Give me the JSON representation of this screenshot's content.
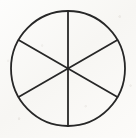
{
  "figure": {
    "title": "Circle divided into six equal sectors",
    "kind": "geometry-diagram",
    "medium": "hand-drawn ink on scanned paper",
    "canvas": {
      "width": 136,
      "height": 138
    },
    "background_color": "#fbfbfa",
    "ink_color": "#272727",
    "circle": {
      "name": "outer-circle",
      "center_x": 68,
      "center_y": 68.5,
      "radius_x": 57,
      "radius_y": 57.5,
      "stroke_width": 1.8,
      "fill": "none"
    },
    "sector_count": 6,
    "sector_angle_degrees": 60,
    "diameters": [
      {
        "name": "vertical-diameter",
        "angle_degrees": 90,
        "x1": 68,
        "y1": 11,
        "x2": 68,
        "y2": 126,
        "stroke_width": 1.8
      },
      {
        "name": "diagonal-diameter-up-right",
        "angle_degrees": 30,
        "x1": 18.6,
        "y1": 40.0,
        "x2": 117.4,
        "y2": 97.0,
        "stroke_width": 1.8
      },
      {
        "name": "diagonal-diameter-up-left",
        "angle_degrees": 150,
        "x1": 18.6,
        "y1": 97.0,
        "x2": 117.4,
        "y2": 40.0,
        "stroke_width": 1.8
      }
    ],
    "center_point": {
      "name": "center-intersection",
      "x": 68,
      "y": 68.5,
      "radius": 1.6
    }
  }
}
